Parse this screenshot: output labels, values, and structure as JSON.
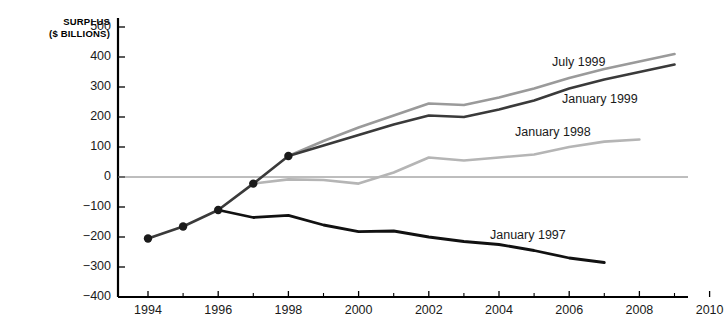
{
  "chart_data": {
    "type": "line",
    "title": "",
    "ylabel_line1": "SURPLUS",
    "ylabel_line2": "($ BILLIONS)",
    "xlabel": "",
    "ylim": [
      -400,
      500
    ],
    "xlim": [
      1993,
      2010
    ],
    "grid": false,
    "zero_line": true,
    "legend_position": "inline-labels",
    "y_ticks": [
      500,
      400,
      300,
      200,
      100,
      0,
      -100,
      -200,
      -300,
      -400
    ],
    "y_tick_labels": [
      "500",
      "400",
      "300",
      "200",
      "100",
      "0",
      "−100",
      "−200",
      "−300",
      "−400"
    ],
    "x_ticks": [
      1994,
      1996,
      1998,
      2000,
      2002,
      2004,
      2006,
      2008,
      2010
    ],
    "x_tick_labels": [
      "1994",
      "1996",
      "1998",
      "2000",
      "2002",
      "2004",
      "2006",
      "2008",
      "2010"
    ],
    "x_minor_ticks": [
      1995,
      1997,
      1999,
      2001,
      2003,
      2005,
      2007,
      2009
    ],
    "series": [
      {
        "name": "Historical",
        "label": "",
        "color": "#3a3a3a",
        "width": 2.6,
        "markers": true,
        "x": [
          1994,
          1995,
          1996,
          1997,
          1998
        ],
        "values": [
          -205,
          -165,
          -110,
          -22,
          70
        ]
      },
      {
        "name": "July 1999",
        "label": "July 1999",
        "color": "#9a9a9a",
        "width": 2.6,
        "markers": false,
        "label_x": 552,
        "label_y": 55,
        "x": [
          1998,
          1999,
          2000,
          2001,
          2002,
          2003,
          2004,
          2005,
          2006,
          2007,
          2008,
          2009
        ],
        "values": [
          70,
          120,
          165,
          205,
          245,
          240,
          265,
          295,
          330,
          360,
          385,
          410
        ]
      },
      {
        "name": "January 1999",
        "label": "January 1999",
        "color": "#3a3a3a",
        "width": 2.6,
        "markers": false,
        "label_x": 562,
        "label_y": 92,
        "x": [
          1998,
          1999,
          2000,
          2001,
          2002,
          2003,
          2004,
          2005,
          2006,
          2007,
          2008,
          2009
        ],
        "values": [
          70,
          105,
          140,
          175,
          205,
          200,
          225,
          255,
          295,
          325,
          350,
          375
        ]
      },
      {
        "name": "January 1998",
        "label": "January 1998",
        "color": "#b5b5b5",
        "width": 2.6,
        "markers": false,
        "label_x": 515,
        "label_y": 125,
        "x": [
          1997,
          1998,
          1999,
          2000,
          2001,
          2002,
          2003,
          2004,
          2005,
          2006,
          2007,
          2008
        ],
        "values": [
          -22,
          -8,
          -10,
          -22,
          15,
          65,
          55,
          65,
          75,
          100,
          118,
          125
        ]
      },
      {
        "name": "January 1997",
        "label": "January 1997",
        "color": "#111111",
        "width": 2.8,
        "markers": false,
        "label_x": 490,
        "label_y": 228,
        "x": [
          1996,
          1997,
          1998,
          1999,
          2000,
          2001,
          2002,
          2003,
          2004,
          2005,
          2006,
          2007
        ],
        "values": [
          -110,
          -135,
          -128,
          -160,
          -182,
          -180,
          -200,
          -215,
          -225,
          -245,
          -270,
          -285
        ]
      }
    ]
  }
}
